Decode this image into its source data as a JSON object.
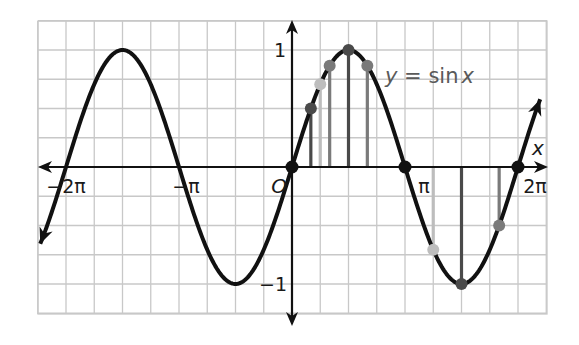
{
  "chart_data": {
    "type": "line",
    "title": "",
    "function_label": "y = sin x",
    "function_label_parts": {
      "lhs": "y",
      "eq": " = sin",
      "var": "x"
    },
    "xlabel": "x",
    "ylabel": "",
    "xlim": [
      -7.2,
      7.0
    ],
    "ylim": [
      -1.3,
      1.3
    ],
    "grid": true,
    "x_tick_labels": [
      {
        "value": -6.2832,
        "label": "−2π"
      },
      {
        "value": -3.1416,
        "label": "−π"
      },
      {
        "value": 0,
        "label": "O"
      },
      {
        "value": 3.1416,
        "label": "π"
      },
      {
        "value": 6.2832,
        "label": "2π"
      }
    ],
    "y_tick_labels": [
      {
        "value": 1,
        "label": "1"
      },
      {
        "value": -1,
        "label": "−1"
      }
    ],
    "series": [
      {
        "name": "y = sin x",
        "x_start": -7.0,
        "x_end": 6.9,
        "function": "sin"
      }
    ],
    "zeros_marked": [
      0,
      3.1416,
      6.2832
    ],
    "stems": [
      {
        "x_label": "π/6",
        "x": 0.5236,
        "y": 0.5,
        "tone": "dark"
      },
      {
        "x_label": "π/4",
        "x": 0.7854,
        "y": 0.7071,
        "tone": "light"
      },
      {
        "x_label": "π/3",
        "x": 1.0472,
        "y": 0.866,
        "tone": "mid"
      },
      {
        "x_label": "π/2",
        "x": 1.5708,
        "y": 1.0,
        "tone": "dark"
      },
      {
        "x_label": "2π/3",
        "x": 2.0944,
        "y": 0.866,
        "tone": "mid"
      },
      {
        "x_label": "5π/4",
        "x": 3.927,
        "y": -0.7071,
        "tone": "light"
      },
      {
        "x_label": "3π/2",
        "x": 4.7124,
        "y": -1.0,
        "tone": "dark"
      },
      {
        "x_label": "11π/6",
        "x": 5.7596,
        "y": -0.5,
        "tone": "mid"
      }
    ]
  },
  "colors": {
    "curve": "#111111",
    "grid": "#c8c8c8",
    "axis": "#111111",
    "label_text": "#5a5a5a",
    "stem_dark": "#4a4a4a",
    "stem_mid": "#7a7a7a",
    "stem_light": "#bdbdbd"
  }
}
